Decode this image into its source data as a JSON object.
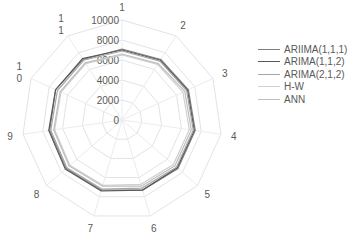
{
  "chart_data": {
    "type": "radar",
    "title": "",
    "categories": [
      "1",
      "2",
      "3",
      "4",
      "5",
      "6",
      "7",
      "8",
      "9",
      "10",
      "11"
    ],
    "axis": {
      "min": 0,
      "max": 10000,
      "step": 2000,
      "tick_labels": [
        "0",
        "2000",
        "4000",
        "6000",
        "8000",
        "10000"
      ]
    },
    "grid": true,
    "legend_position": "right",
    "series": [
      {
        "name": "ARIIMA(1,1,1)",
        "color": "#7f7f7f",
        "values": [
          7100,
          7200,
          7300,
          7400,
          7400,
          7300,
          7300,
          7400,
          7300,
          7300,
          7200
        ]
      },
      {
        "name": "ARIMA(1,1,2)",
        "color": "#595959",
        "values": [
          7000,
          7100,
          7200,
          7300,
          7300,
          7300,
          7400,
          7500,
          7400,
          7300,
          7300
        ]
      },
      {
        "name": "ARIMA(2,1,2)",
        "color": "#a6a6a6",
        "values": [
          6900,
          7000,
          7100,
          7200,
          7200,
          7100,
          7200,
          7300,
          7200,
          7100,
          7100
        ]
      },
      {
        "name": "H-W",
        "color": "#d0d0d0",
        "values": [
          6500,
          6600,
          6700,
          6800,
          6800,
          6700,
          6800,
          6900,
          6800,
          6700,
          6700
        ]
      },
      {
        "name": "ANN",
        "color": "#bfbfbf",
        "values": [
          6600,
          6700,
          6900,
          7000,
          7000,
          6900,
          6900,
          7000,
          6900,
          6800,
          6800
        ]
      }
    ]
  },
  "legend": {
    "items": [
      "ARIIMA(1,1,1)",
      "ARIMA(1,1,2)",
      "ARIMA(2,1,2)",
      "H-W",
      "ANN"
    ]
  }
}
